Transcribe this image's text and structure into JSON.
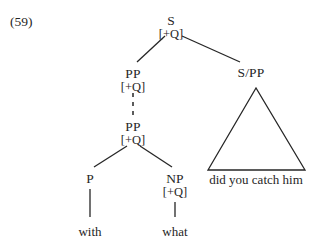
{
  "figure": {
    "example_number": "(59)"
  },
  "nodes": {
    "root": {
      "category": "S",
      "feature": "[+Q]",
      "x": 171,
      "y": 14
    },
    "pp_upper": {
      "category": "PP",
      "feature": "[+Q]",
      "x": 133,
      "y": 67
    },
    "pp_lower": {
      "category": "PP",
      "feature": "[+Q]",
      "x": 133,
      "y": 120
    },
    "p": {
      "category": "P",
      "feature": "",
      "x": 90,
      "y": 172
    },
    "np": {
      "category": "NP",
      "feature": "[+Q]",
      "x": 175,
      "y": 172
    },
    "s_slash_pp": {
      "category": "S/PP",
      "feature": "",
      "x": 251,
      "y": 66
    }
  },
  "leaves": {
    "with": {
      "text": "with",
      "x": 90,
      "y": 224
    },
    "what": {
      "text": "what",
      "x": 175,
      "y": 224
    }
  },
  "triangle": {
    "gloss": "did you catch him",
    "apex_x": 256,
    "apex_y": 88,
    "base_left_x": 208,
    "base_right_x": 305,
    "base_y": 170,
    "gloss_x": 256,
    "gloss_y": 172
  },
  "edges": [
    {
      "name": "root-to-pp",
      "style": "solid",
      "x1": 165,
      "y1": 36,
      "x2": 137,
      "y2": 62
    },
    {
      "name": "root-to-s-slash-pp",
      "style": "solid",
      "x1": 182,
      "y1": 36,
      "x2": 240,
      "y2": 62
    },
    {
      "name": "pp-upper-to-pp-lower",
      "style": "dashed",
      "x1": 133,
      "y1": 93,
      "x2": 133,
      "y2": 116
    },
    {
      "name": "pp-lower-to-p",
      "style": "solid",
      "x1": 127,
      "y1": 146,
      "x2": 94,
      "y2": 167
    },
    {
      "name": "pp-lower-to-np",
      "style": "solid",
      "x1": 140,
      "y1": 146,
      "x2": 172,
      "y2": 167
    },
    {
      "name": "p-to-with",
      "style": "solid",
      "x1": 90,
      "y1": 189,
      "x2": 90,
      "y2": 217
    },
    {
      "name": "np-to-what",
      "style": "solid",
      "x1": 175,
      "y1": 202,
      "x2": 175,
      "y2": 217
    }
  ],
  "colors": {
    "ink": "#262626",
    "background": "#ffffff"
  }
}
